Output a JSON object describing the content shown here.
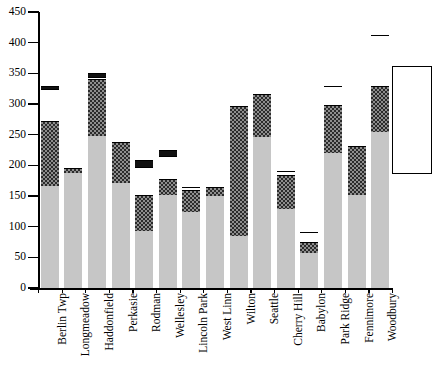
{
  "chart_data": {
    "type": "bar",
    "subtype": "stacked-vertical",
    "title": "",
    "xlabel": "",
    "ylabel": "",
    "ylim": [
      0,
      450
    ],
    "ytick_step": 50,
    "yticks": [
      0,
      50,
      100,
      150,
      200,
      250,
      300,
      350,
      400,
      450
    ],
    "ytick_labels": [
      "0",
      "50",
      "100",
      "150",
      "200",
      "250",
      "300",
      "350",
      "400",
      "450"
    ],
    "grid": false,
    "legend_position": "right",
    "legend_entries": [],
    "categories": [
      "Berlin Twp",
      "Longmeadow",
      "Haddonfield",
      "Perkasie",
      "Rodman",
      "Wellesley",
      "Lincoln Park",
      "West Linn",
      "Wilton",
      "Seattle",
      "Cherry Hill",
      "Babylon",
      "Park Ridge",
      "Fennimore",
      "Woodbury"
    ],
    "series": [
      {
        "name": "series-1",
        "fill": "light-gray",
        "color": "#c6c6c6",
        "values": [
          167,
          188,
          248,
          172,
          93,
          152,
          124,
          150,
          84,
          247,
          129,
          57,
          220,
          151,
          255
        ]
      },
      {
        "name": "series-2",
        "fill": "dark-hatch",
        "color": "#8e8e8e",
        "values": [
          105,
          7,
          92,
          66,
          59,
          26,
          36,
          15,
          212,
          70,
          56,
          18,
          79,
          81,
          75
        ]
      },
      {
        "name": "series-3",
        "fill": "white",
        "color": "#ffffff",
        "values": [
          53,
          0,
          4,
          0,
          45,
          37,
          5,
          0,
          0,
          0,
          6,
          16,
          31,
          0,
          82
        ]
      },
      {
        "name": "series-4",
        "fill": "black",
        "color": "#111111",
        "values": [
          5,
          0,
          6,
          0,
          11,
          10,
          0,
          0,
          0,
          0,
          0,
          0,
          0,
          0,
          0
        ]
      }
    ],
    "totals": [
      330,
      195,
      350,
      238,
      208,
      225,
      165,
      165,
      296,
      317,
      191,
      91,
      330,
      232,
      412
    ]
  },
  "axes": {
    "y_min_label": "0",
    "y_max_label": "450"
  }
}
